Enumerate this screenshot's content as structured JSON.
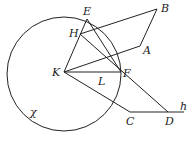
{
  "diagram": {
    "circle": {
      "cx": 64,
      "cy": 74,
      "r": 57,
      "label": "χ"
    },
    "points": {
      "E": {
        "x": 87,
        "y": 19,
        "label": "E"
      },
      "B": {
        "x": 157,
        "y": 9,
        "label": "B"
      },
      "H": {
        "x": 80,
        "y": 34,
        "label": "H"
      },
      "A": {
        "x": 140,
        "y": 46,
        "label": "A"
      },
      "K": {
        "x": 64,
        "y": 72,
        "label": "K"
      },
      "L": {
        "x": 103,
        "y": 72,
        "label": "L"
      },
      "F": {
        "x": 121,
        "y": 72,
        "label": "F"
      },
      "C": {
        "x": 130,
        "y": 112,
        "label": "C"
      },
      "D": {
        "x": 168,
        "y": 112,
        "label": "D"
      },
      "h": {
        "x": 184,
        "y": 112,
        "label": "h"
      }
    },
    "segments": [
      [
        "H",
        "B"
      ],
      [
        "B",
        "A"
      ],
      [
        "A",
        "K"
      ],
      [
        "K",
        "H"
      ],
      [
        "H",
        "E"
      ],
      [
        "E",
        "F"
      ],
      [
        "H",
        "D"
      ],
      [
        "K",
        "F"
      ],
      [
        "K",
        "C"
      ],
      [
        "C",
        "h"
      ]
    ]
  }
}
